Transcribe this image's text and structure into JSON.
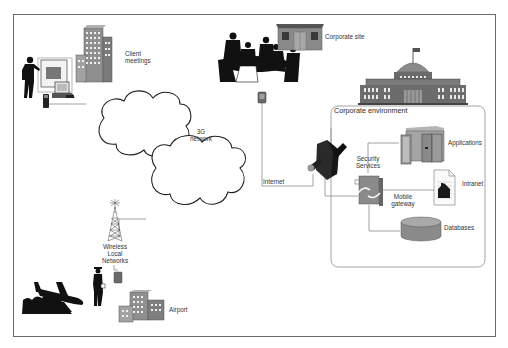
{
  "diagram": {
    "type": "mobile-enterprise-network-architecture",
    "colors": {
      "frame_border": "#6a6a6a",
      "line": "#8a8a8a",
      "building_fill": "#8c8c8c",
      "building_dark": "#5a5a5a",
      "silhouette": "#111111",
      "cloud_stroke": "#222222",
      "container_border": "#9a9a9a"
    },
    "nodes": {
      "client_meetings": {
        "label_line1": "Client",
        "label_line2": "meetings"
      },
      "corporate_site": {
        "label": "Corporate site"
      },
      "network_3g": {
        "label_line1": "3G",
        "label_line2": "network"
      },
      "internet": {
        "label": "Internet"
      },
      "wireless_lan": {
        "label_line1": "Wireless",
        "label_line2": "Local",
        "label_line3": "Networks"
      },
      "airport": {
        "label": "Airport"
      },
      "corporate_environment": {
        "label": "Corporate environment"
      },
      "security_services": {
        "label_line1": "Security",
        "label_line2": "Services"
      },
      "mobile_gateway": {
        "label_line1": "Mobile",
        "label_line2": "gateway"
      },
      "applications": {
        "label": "Applications"
      },
      "intranet": {
        "label": "Intranet"
      },
      "databases": {
        "label": "Databases"
      }
    },
    "icons": [
      "presenter-icon",
      "office-building-icon",
      "laptop-icon",
      "mobile-phone-icon",
      "meeting-group-icon",
      "small-office-icon",
      "capitol-building-icon",
      "pda-icon",
      "cloud-icon",
      "firewall-lock-icon",
      "gateway-icon",
      "server-rack-icon",
      "document-house-icon",
      "database-icon",
      "radio-tower-icon",
      "traveler-icon",
      "airplane-icon",
      "airport-building-icon"
    ]
  }
}
